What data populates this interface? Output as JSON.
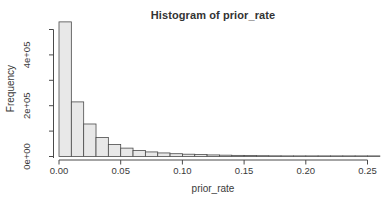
{
  "window": {
    "width": 392,
    "height": 212,
    "background": "#ffffff"
  },
  "chart_data": {
    "type": "bar",
    "subtype": "histogram",
    "title": "Histogram of prior_rate",
    "xlabel": "prior_rate",
    "ylabel": "Frequency",
    "bin_start": 0,
    "bin_width": 0.01,
    "counts": [
      530000,
      215000,
      128000,
      75000,
      47000,
      33000,
      24000,
      18000,
      14000,
      11000,
      9000,
      7500,
      6200,
      5200,
      4400,
      3700,
      3100,
      2600,
      2200,
      1900,
      1600,
      1400,
      1200,
      1000,
      900,
      800
    ],
    "x_tick_values": [
      0.0,
      0.05,
      0.1,
      0.15,
      0.2,
      0.25
    ],
    "x_tick_labels": [
      "0.00",
      "0.05",
      "0.10",
      "0.15",
      "0.20",
      "0.25"
    ],
    "y_tick_values": [
      0,
      100000,
      200000,
      300000,
      400000,
      500000
    ],
    "y_tick_labels": [
      "0e+00",
      "",
      "2e+05",
      "",
      "4e+05",
      ""
    ],
    "xlim": [
      0,
      0.27
    ],
    "ylim": [
      0,
      500000
    ],
    "grid": "off",
    "legend": "none",
    "colors": {
      "bar_fill": "#e8e8e8",
      "bar_border": "#4a4a4a",
      "axis": "#4a4a4a",
      "text": "#3a3a3a"
    }
  }
}
